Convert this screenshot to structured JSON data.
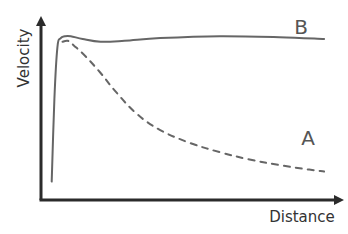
{
  "chart_data": {
    "type": "line",
    "title": "",
    "xlabel": "Distance",
    "ylabel": "Velocity",
    "xlim": [
      0,
      1
    ],
    "ylim": [
      0,
      1
    ],
    "grid": false,
    "ticks": "none",
    "axis_color": "#2b2b2b",
    "series": [
      {
        "name": "B",
        "style": "solid",
        "color": "#666666",
        "x": [
          0.036,
          0.045,
          0.055,
          0.066,
          0.08,
          0.1,
          0.14,
          0.2,
          0.28,
          0.4,
          0.6,
          0.8,
          0.95
        ],
        "y": [
          0.1,
          0.55,
          0.83,
          0.88,
          0.89,
          0.89,
          0.875,
          0.86,
          0.865,
          0.88,
          0.89,
          0.885,
          0.875
        ]
      },
      {
        "name": "A",
        "style": "dashed",
        "color": "#666666",
        "x": [
          0.072,
          0.09,
          0.11,
          0.15,
          0.2,
          0.25,
          0.32,
          0.4,
          0.5,
          0.6,
          0.7,
          0.8,
          0.9,
          0.95
        ],
        "y": [
          0.86,
          0.865,
          0.84,
          0.78,
          0.69,
          0.59,
          0.47,
          0.38,
          0.31,
          0.26,
          0.22,
          0.19,
          0.165,
          0.155
        ]
      }
    ],
    "annotations": [
      {
        "text": "B",
        "series": "B",
        "position": "above line end"
      },
      {
        "text": "A",
        "series": "A",
        "position": "above line end"
      }
    ]
  }
}
